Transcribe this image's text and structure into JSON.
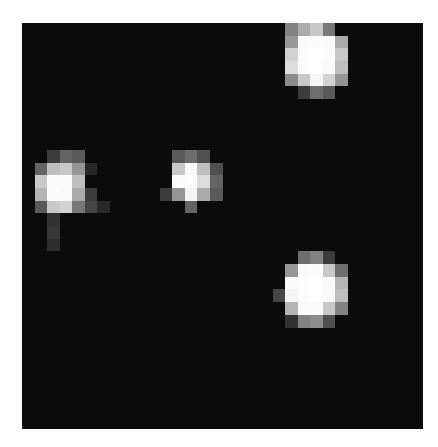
{
  "image": {
    "description": "Pixelated grayscale image: black square with four bright white blobs",
    "grid": {
      "cols": 32,
      "rows": 32
    },
    "background": "#0b0b0b",
    "blobs": [
      {
        "name": "top-right-blob",
        "cells": [
          [
            0,
            21,
            130
          ],
          [
            0,
            22,
            170
          ],
          [
            0,
            23,
            200
          ],
          [
            0,
            24,
            120
          ],
          [
            1,
            21,
            150
          ],
          [
            1,
            22,
            250
          ],
          [
            1,
            23,
            252
          ],
          [
            1,
            24,
            250
          ],
          [
            1,
            25,
            170
          ],
          [
            2,
            21,
            210
          ],
          [
            2,
            22,
            252
          ],
          [
            2,
            23,
            255
          ],
          [
            2,
            24,
            252
          ],
          [
            2,
            25,
            200
          ],
          [
            3,
            21,
            220
          ],
          [
            3,
            22,
            252
          ],
          [
            3,
            23,
            255
          ],
          [
            3,
            24,
            250
          ],
          [
            3,
            25,
            190
          ],
          [
            4,
            21,
            140
          ],
          [
            4,
            22,
            200
          ],
          [
            4,
            23,
            245
          ],
          [
            4,
            24,
            210
          ],
          [
            4,
            25,
            150
          ],
          [
            5,
            22,
            60
          ],
          [
            5,
            23,
            110
          ],
          [
            5,
            24,
            90
          ]
        ]
      },
      {
        "name": "left-blob",
        "cells": [
          [
            10,
            2,
            60
          ],
          [
            10,
            3,
            100
          ],
          [
            10,
            4,
            90
          ],
          [
            11,
            1,
            100
          ],
          [
            11,
            2,
            190
          ],
          [
            11,
            3,
            200
          ],
          [
            11,
            4,
            150
          ],
          [
            11,
            5,
            40
          ],
          [
            12,
            1,
            200
          ],
          [
            12,
            2,
            252
          ],
          [
            12,
            3,
            252
          ],
          [
            12,
            4,
            190
          ],
          [
            13,
            1,
            180
          ],
          [
            13,
            2,
            252
          ],
          [
            13,
            3,
            250
          ],
          [
            13,
            4,
            170
          ],
          [
            13,
            5,
            60
          ],
          [
            14,
            1,
            90
          ],
          [
            14,
            2,
            200
          ],
          [
            14,
            3,
            210
          ],
          [
            14,
            4,
            120
          ],
          [
            14,
            5,
            70
          ],
          [
            14,
            6,
            40
          ],
          [
            15,
            2,
            50
          ],
          [
            16,
            2,
            55
          ],
          [
            17,
            2,
            45
          ]
        ]
      },
      {
        "name": "middle-blob",
        "cells": [
          [
            10,
            12,
            90
          ],
          [
            10,
            13,
            110
          ],
          [
            10,
            14,
            80
          ],
          [
            11,
            12,
            200
          ],
          [
            11,
            13,
            250
          ],
          [
            11,
            14,
            190
          ],
          [
            11,
            15,
            80
          ],
          [
            12,
            12,
            250
          ],
          [
            12,
            13,
            252
          ],
          [
            12,
            14,
            220
          ],
          [
            12,
            15,
            100
          ],
          [
            13,
            11,
            60
          ],
          [
            13,
            12,
            150
          ],
          [
            13,
            13,
            245
          ],
          [
            13,
            14,
            170
          ],
          [
            13,
            15,
            90
          ],
          [
            14,
            13,
            100
          ]
        ]
      },
      {
        "name": "bottom-right-blob",
        "cells": [
          [
            18,
            22,
            110
          ],
          [
            18,
            23,
            130
          ],
          [
            18,
            24,
            60
          ],
          [
            19,
            21,
            150
          ],
          [
            19,
            22,
            250
          ],
          [
            19,
            23,
            252
          ],
          [
            19,
            24,
            200
          ],
          [
            19,
            25,
            110
          ],
          [
            20,
            21,
            250
          ],
          [
            20,
            22,
            252
          ],
          [
            20,
            23,
            255
          ],
          [
            20,
            24,
            250
          ],
          [
            20,
            25,
            180
          ],
          [
            21,
            20,
            70
          ],
          [
            21,
            21,
            245
          ],
          [
            21,
            22,
            252
          ],
          [
            21,
            23,
            255
          ],
          [
            21,
            24,
            250
          ],
          [
            21,
            25,
            190
          ],
          [
            22,
            21,
            180
          ],
          [
            22,
            22,
            250
          ],
          [
            22,
            23,
            250
          ],
          [
            22,
            24,
            200
          ],
          [
            22,
            25,
            130
          ],
          [
            23,
            21,
            50
          ],
          [
            23,
            22,
            130
          ],
          [
            23,
            23,
            140
          ],
          [
            23,
            24,
            80
          ]
        ]
      }
    ]
  }
}
